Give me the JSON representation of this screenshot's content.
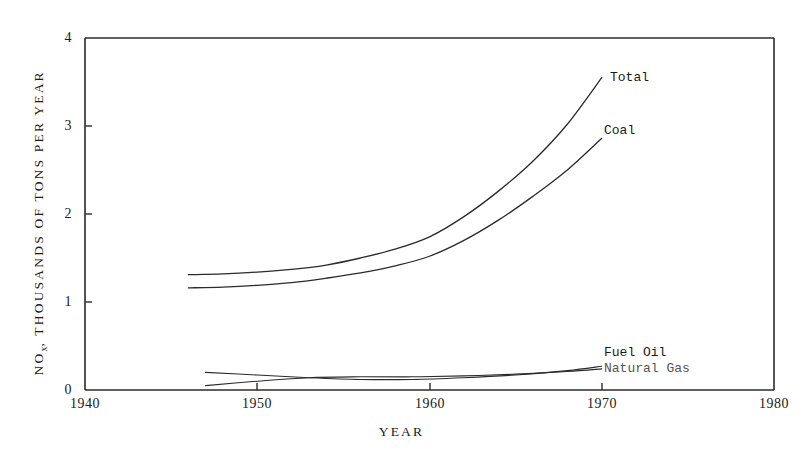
{
  "chart_data": {
    "type": "line",
    "title": "",
    "xlabel": "YEAR",
    "ylabel": "NO_x, THOUSANDS OF TONS PER YEAR",
    "ylabel_base": "NO",
    "ylabel_sub": "x",
    "ylabel_rest": ", THOUSANDS OF TONS PER YEAR",
    "xlim": [
      1940,
      1980
    ],
    "ylim": [
      0,
      4
    ],
    "xticks": [
      1940,
      1950,
      1960,
      1970,
      1980
    ],
    "xtick_labels": [
      "1940",
      "1950",
      "1960",
      "1970",
      "1980"
    ],
    "yticks": [
      0,
      1,
      2,
      3,
      4
    ],
    "ytick_labels": [
      "0",
      "1",
      "2",
      "3",
      "4"
    ],
    "grid": false,
    "legend_position": "inline-right-annotations",
    "series": [
      {
        "name": "Total",
        "label": "Total",
        "x": [
          1946.0,
          1948.0,
          1950.0,
          1952.0,
          1954.0,
          1956.0,
          1958.0,
          1960.0,
          1962.0,
          1964.0,
          1966.0,
          1968.0,
          1970.0
        ],
        "values": [
          1.31,
          1.32,
          1.34,
          1.37,
          1.42,
          1.5,
          1.6,
          1.74,
          1.97,
          2.26,
          2.6,
          3.02,
          3.55
        ]
      },
      {
        "name": "Coal",
        "label": "Coal",
        "x": [
          1946.0,
          1948.0,
          1950.0,
          1952.0,
          1954.0,
          1956.0,
          1958.0,
          1960.0,
          1962.0,
          1964.0,
          1966.0,
          1968.0,
          1970.0
        ],
        "values": [
          1.16,
          1.17,
          1.19,
          1.22,
          1.27,
          1.33,
          1.41,
          1.52,
          1.7,
          1.93,
          2.2,
          2.5,
          2.86
        ]
      },
      {
        "name": "Fuel Oil",
        "label": "Fuel Oil",
        "x": [
          1947.0,
          1950.0,
          1953.0,
          1956.0,
          1959.0,
          1962.0,
          1965.0,
          1968.0,
          1970.0
        ],
        "values": [
          0.2,
          0.17,
          0.14,
          0.12,
          0.12,
          0.14,
          0.17,
          0.22,
          0.27
        ]
      },
      {
        "name": "Natural Gas",
        "label": "Natural Gas",
        "x": [
          1947.0,
          1950.0,
          1953.0,
          1956.0,
          1959.0,
          1962.0,
          1965.0,
          1968.0,
          1970.0
        ],
        "values": [
          0.05,
          0.1,
          0.14,
          0.15,
          0.15,
          0.16,
          0.18,
          0.21,
          0.24
        ]
      }
    ],
    "annotations": [
      {
        "text": "Total",
        "x": 1971.5,
        "y": 3.62
      },
      {
        "text": "Coal",
        "x": 1971.5,
        "y": 2.9
      },
      {
        "text": "Fuel Oil",
        "x": 1971.5,
        "y": 0.35
      },
      {
        "text": "Natural Gas",
        "x": 1971.5,
        "y": 0.22
      }
    ]
  }
}
